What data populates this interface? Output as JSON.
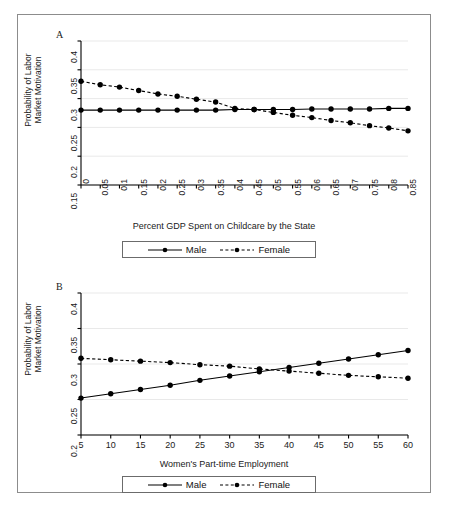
{
  "figure": {
    "background": "#ffffff",
    "frame_color": "#8c8c8c",
    "series_color": "#000000"
  },
  "panel_a": {
    "letter": "A",
    "legend": {
      "male_label": "Male",
      "female_label": "Female"
    }
  },
  "panel_b": {
    "letter": "B",
    "legend": {
      "male_label": "Male",
      "female_label": "Female"
    }
  },
  "chart_data": [
    {
      "type": "line",
      "panel": "A",
      "title": "",
      "xlabel": "Percent GDP Spent on Childcare by the State",
      "ylabel": "Probability of Labor Market Motivation",
      "ylabel_line1": "Probability of Labor",
      "ylabel_line2": "Market Motivation",
      "x": [
        0,
        0.05,
        0.1,
        0.15,
        0.2,
        0.25,
        0.3,
        0.35,
        0.4,
        0.45,
        0.5,
        0.55,
        0.6,
        0.65,
        0.7,
        0.75,
        0.8,
        0.85
      ],
      "xticks": [
        "0",
        "0.05",
        "0.1",
        "0.15",
        "0.2",
        "0.25",
        "0.3",
        "0.35",
        "0.4",
        "0.45",
        "0.5",
        "0.55",
        "0.6",
        "0.65",
        "0.7",
        "0.75",
        "0.8",
        "0.85"
      ],
      "yticks": [
        "0.15",
        "0.2",
        "0.25",
        "0.3",
        "0.35",
        "0.4"
      ],
      "ytickvals": [
        0.15,
        0.2,
        0.25,
        0.3,
        0.35,
        0.4
      ],
      "xlim": [
        0,
        0.85
      ],
      "ylim": [
        0.15,
        0.4
      ],
      "grid": true,
      "legend_position": "below",
      "series": [
        {
          "name": "Male",
          "style": "solid",
          "marker": "circle",
          "values": [
            0.28,
            0.28,
            0.28,
            0.28,
            0.28,
            0.28,
            0.28,
            0.28,
            0.281,
            0.281,
            0.281,
            0.281,
            0.282,
            0.282,
            0.282,
            0.282,
            0.283,
            0.283
          ]
        },
        {
          "name": "Female",
          "style": "dashed",
          "marker": "circle",
          "values": [
            0.33,
            0.324,
            0.32,
            0.314,
            0.308,
            0.304,
            0.299,
            0.294,
            0.283,
            0.281,
            0.276,
            0.271,
            0.267,
            0.262,
            0.258,
            0.253,
            0.249,
            0.244
          ]
        }
      ]
    },
    {
      "type": "line",
      "panel": "B",
      "title": "",
      "xlabel": "Women's Part-time Employment",
      "ylabel": "Probability of Labor Market Motivation",
      "ylabel_line1": "Probability of Labor",
      "ylabel_line2": "Market Motivation",
      "x": [
        5,
        10,
        15,
        20,
        25,
        30,
        35,
        40,
        45,
        50,
        55,
        60
      ],
      "xticks": [
        "5",
        "10",
        "15",
        "20",
        "25",
        "30",
        "35",
        "40",
        "45",
        "50",
        "55",
        "60"
      ],
      "yticks": [
        "0.2",
        "0.25",
        "0.3",
        "0.35",
        "0.4"
      ],
      "ytickvals": [
        0.2,
        0.25,
        0.3,
        0.35,
        0.4
      ],
      "xlim": [
        5,
        60
      ],
      "ylim": [
        0.2,
        0.4
      ],
      "grid": true,
      "legend_position": "below",
      "series": [
        {
          "name": "Male",
          "style": "solid",
          "marker": "circle",
          "values": [
            0.252,
            0.258,
            0.264,
            0.27,
            0.277,
            0.283,
            0.289,
            0.295,
            0.301,
            0.307,
            0.313,
            0.319
          ]
        },
        {
          "name": "Female",
          "style": "dashed",
          "marker": "circle",
          "values": [
            0.308,
            0.306,
            0.304,
            0.302,
            0.299,
            0.297,
            0.293,
            0.29,
            0.287,
            0.284,
            0.282,
            0.28
          ]
        }
      ]
    }
  ]
}
